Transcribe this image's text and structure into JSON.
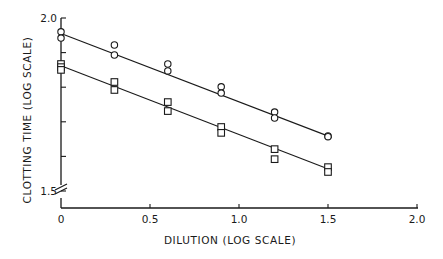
{
  "chart_data": {
    "type": "scatter",
    "title": "",
    "xlabel": "DILUTION (LOG SCALE)",
    "ylabel": "CLOTTING TIME (LOG SCALE)",
    "xlim": [
      0,
      2.0
    ],
    "ylim": [
      1.5,
      2.0
    ],
    "x_ticks": [
      0,
      0.5,
      1.0,
      1.5,
      2.0
    ],
    "x_tick_labels": [
      "0",
      "0.5",
      "1.0",
      "1.5",
      "2.0"
    ],
    "y_ticks": [
      1.5,
      1.6,
      1.7,
      1.8,
      1.9,
      2.0
    ],
    "y_tick_labels": [
      "1.5",
      "",
      "",
      "",
      "",
      "2.0"
    ],
    "y_axis_break": true,
    "grid": false,
    "legend": null,
    "series": [
      {
        "name": "circles",
        "marker": "circle",
        "points": [
          [
            0,
            1.96
          ],
          [
            0,
            1.942
          ],
          [
            0.3,
            1.922
          ],
          [
            0.3,
            1.893
          ],
          [
            0.6,
            1.867
          ],
          [
            0.6,
            1.847
          ],
          [
            0.9,
            1.801
          ],
          [
            0.9,
            1.783
          ],
          [
            1.2,
            1.728
          ],
          [
            1.2,
            1.711
          ],
          [
            1.5,
            1.659
          ],
          [
            1.5,
            1.657
          ]
        ],
        "fit_line": [
          [
            0,
            1.955
          ],
          [
            1.52,
            1.655
          ]
        ]
      },
      {
        "name": "squares",
        "marker": "square",
        "points": [
          [
            0,
            1.867
          ],
          [
            0,
            1.858
          ],
          [
            0,
            1.85
          ],
          [
            0.3,
            1.815
          ],
          [
            0.3,
            1.792
          ],
          [
            0.6,
            1.757
          ],
          [
            0.6,
            1.731
          ],
          [
            0.9,
            1.685
          ],
          [
            0.9,
            1.668
          ],
          [
            1.2,
            1.621
          ],
          [
            1.2,
            1.592
          ],
          [
            1.5,
            1.569
          ],
          [
            1.5,
            1.555
          ]
        ],
        "fit_line": [
          [
            0,
            1.862
          ],
          [
            1.52,
            1.56
          ]
        ]
      }
    ]
  },
  "colors": {
    "ink": "#1a1a1a",
    "background": "#ffffff"
  }
}
